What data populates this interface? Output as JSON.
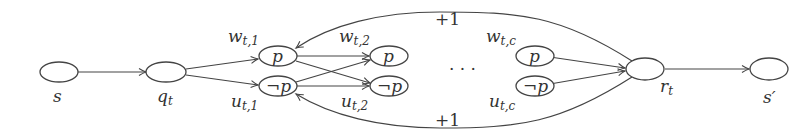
{
  "diagram": {
    "nodes": {
      "s": {
        "label": "s",
        "position": "below"
      },
      "q": {
        "label": "q",
        "sub": "t",
        "position": "below"
      },
      "p1": {
        "label": "p",
        "position": "inside"
      },
      "np1": {
        "label": "¬p",
        "position": "inside"
      },
      "p2": {
        "label": "p",
        "position": "inside"
      },
      "np2": {
        "label": "¬p",
        "position": "inside"
      },
      "pc": {
        "label": "p",
        "position": "inside"
      },
      "npc": {
        "label": "¬p",
        "position": "inside"
      },
      "r": {
        "label": "r",
        "sub": "t",
        "position": "below"
      },
      "s_prime": {
        "label": "s′",
        "position": "below"
      }
    },
    "weights": {
      "w1": {
        "main": "w",
        "sub": "t,1"
      },
      "u1": {
        "main": "u",
        "sub": "t,1"
      },
      "w2": {
        "main": "w",
        "sub": "t,2"
      },
      "u2": {
        "main": "u",
        "sub": "t,2"
      },
      "wc": {
        "main": "w",
        "sub": "t,c"
      },
      "uc": {
        "main": "u",
        "sub": "t,c"
      }
    },
    "ellipsis": "· · ·",
    "top_edge_label": "+1",
    "bottom_edge_label": "+1",
    "edges": [
      [
        "s",
        "q"
      ],
      [
        "q",
        "p1"
      ],
      [
        "q",
        "np1"
      ],
      [
        "p1",
        "p2"
      ],
      [
        "p1",
        "np2"
      ],
      [
        "np1",
        "p2"
      ],
      [
        "np1",
        "np2"
      ],
      [
        "pc",
        "r"
      ],
      [
        "npc",
        "r"
      ],
      [
        "r",
        "s_prime"
      ],
      [
        "r",
        "p1",
        "+1"
      ],
      [
        "r",
        "np1",
        "+1"
      ]
    ]
  }
}
